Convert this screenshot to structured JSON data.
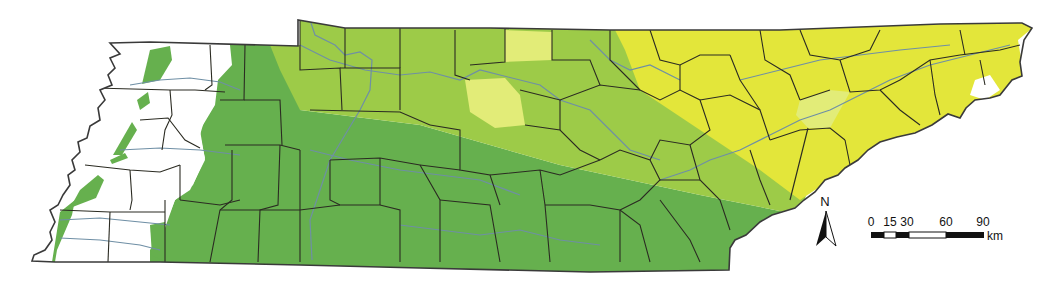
{
  "map": {
    "region": "Tennessee",
    "zones": [
      {
        "name": "zone-white",
        "color": "#ffffff"
      },
      {
        "name": "zone-dark-green",
        "color": "#66b04e"
      },
      {
        "name": "zone-light-green",
        "color": "#9dcb48"
      },
      {
        "name": "zone-yellow",
        "color": "#e3e63a"
      },
      {
        "name": "zone-pale-yellow",
        "color": "#e2ec78"
      }
    ],
    "colors": {
      "county_border": "#2b2b22",
      "river": "#6f8fa5",
      "outline": "#3a3a3a"
    }
  },
  "north_arrow": {
    "label": "N"
  },
  "scale_bar": {
    "ticks": [
      "0",
      "15",
      "30",
      "60",
      "90"
    ],
    "unit": "km"
  }
}
